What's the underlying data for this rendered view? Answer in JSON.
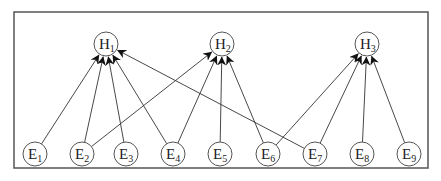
{
  "diagram": {
    "type": "bipartite-directed-graph",
    "frame": {
      "x": 14,
      "y": 12,
      "width": 414,
      "height": 156,
      "stroke": "#555555"
    },
    "colors": {
      "edge": "#333333",
      "node_stroke": "#555555",
      "text": "#222222"
    },
    "hidden_nodes": [
      {
        "id": "H1",
        "letter": "H",
        "sub": "1",
        "x": 106,
        "y": 44
      },
      {
        "id": "H2",
        "letter": "H",
        "sub": "2",
        "x": 222,
        "y": 44
      },
      {
        "id": "H3",
        "letter": "H",
        "sub": "3",
        "x": 367,
        "y": 44
      }
    ],
    "evidence_nodes": [
      {
        "id": "E1",
        "letter": "E",
        "sub": "1",
        "x": 35,
        "y": 154
      },
      {
        "id": "E2",
        "letter": "E",
        "sub": "2",
        "x": 82,
        "y": 154
      },
      {
        "id": "E3",
        "letter": "E",
        "sub": "3",
        "x": 126,
        "y": 154
      },
      {
        "id": "E4",
        "letter": "E",
        "sub": "4",
        "x": 173,
        "y": 154
      },
      {
        "id": "E5",
        "letter": "E",
        "sub": "5",
        "x": 220,
        "y": 154
      },
      {
        "id": "E6",
        "letter": "E",
        "sub": "6",
        "x": 268,
        "y": 154
      },
      {
        "id": "E7",
        "letter": "E",
        "sub": "7",
        "x": 315,
        "y": 154
      },
      {
        "id": "E8",
        "letter": "E",
        "sub": "8",
        "x": 362,
        "y": 154
      },
      {
        "id": "E9",
        "letter": "E",
        "sub": "9",
        "x": 409,
        "y": 154
      }
    ],
    "edges": [
      {
        "from": "E1",
        "to": "H1"
      },
      {
        "from": "E2",
        "to": "H1"
      },
      {
        "from": "E2",
        "to": "H2"
      },
      {
        "from": "E3",
        "to": "H1"
      },
      {
        "from": "E4",
        "to": "H1"
      },
      {
        "from": "E4",
        "to": "H2"
      },
      {
        "from": "E5",
        "to": "H2"
      },
      {
        "from": "E6",
        "to": "H2"
      },
      {
        "from": "E6",
        "to": "H3"
      },
      {
        "from": "E7",
        "to": "H1"
      },
      {
        "from": "E7",
        "to": "H3"
      },
      {
        "from": "E8",
        "to": "H3"
      },
      {
        "from": "E9",
        "to": "H3"
      }
    ]
  }
}
